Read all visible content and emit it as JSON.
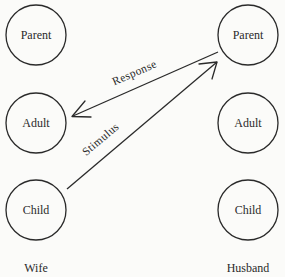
{
  "diagram": {
    "type": "transactional-analysis-crossed-transaction",
    "columns": {
      "left": {
        "label": "Wife",
        "states": [
          {
            "id": "wife-parent",
            "label": "Parent"
          },
          {
            "id": "wife-adult",
            "label": "Adult"
          },
          {
            "id": "wife-child",
            "label": "Child"
          }
        ]
      },
      "right": {
        "label": "Husband",
        "states": [
          {
            "id": "husband-parent",
            "label": "Parent"
          },
          {
            "id": "husband-adult",
            "label": "Adult"
          },
          {
            "id": "husband-child",
            "label": "Child"
          }
        ]
      }
    },
    "transactions": [
      {
        "id": "stimulus",
        "label": "Stimulus",
        "from": "wife-child",
        "to": "husband-parent"
      },
      {
        "id": "response",
        "label": "Response",
        "from": "husband-parent",
        "to": "wife-adult"
      }
    ],
    "colors": {
      "ink": "#2a2a2a",
      "background": "#fbfbf9"
    }
  }
}
